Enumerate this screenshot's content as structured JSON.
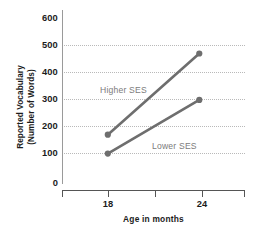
{
  "chart_data": {
    "type": "line",
    "title": "",
    "xlabel": "Age in months",
    "ylabel": "Reported Vocabulary (Number of Words)",
    "ylabel_line1": "Reported Vocabulary",
    "ylabel_line2": "(Number of Words)",
    "x": [
      18,
      24
    ],
    "xtick_labels": [
      "18",
      "24"
    ],
    "ytick_labels": [
      "0",
      "100",
      "200",
      "300",
      "400",
      "500",
      "600"
    ],
    "yticks": [
      0,
      100,
      200,
      300,
      400,
      500,
      600
    ],
    "ylim": [
      0,
      600
    ],
    "xlim": [
      15,
      27
    ],
    "grid": "horizontal-dotted",
    "gridline_values": [
      100,
      200,
      300,
      400,
      500
    ],
    "legend_position": "inline-annotation",
    "series": [
      {
        "name": "Higher SES",
        "values": [
          170,
          450
        ],
        "color": "#6e6e6e",
        "label_x": 100,
        "label_y": 85
      },
      {
        "name": "Lower SES",
        "values": [
          105,
          290
        ],
        "color": "#6e6e6e",
        "label_x": 152,
        "label_y": 141
      }
    ],
    "colors": {
      "line": "#6e6e6e",
      "marker": "#6e6e6e",
      "gridline": "#b9b9b9",
      "axis": "#555555",
      "axis_text": "#1c1c1c",
      "series_label": "#7b7b7b",
      "background": "#ffffff"
    }
  }
}
